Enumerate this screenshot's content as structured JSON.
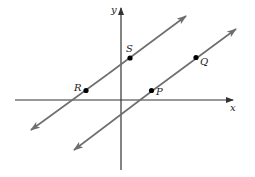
{
  "diagram": {
    "type": "coordinate-plane",
    "colors": {
      "axis": "#333333",
      "line": "#6e6e6e",
      "point": "#000000",
      "text": "#222222"
    },
    "axes": {
      "x": {
        "label": "x"
      },
      "y": {
        "label": "y"
      }
    },
    "lines": [
      {
        "name": "line-RS",
        "points": [
          "R",
          "S"
        ]
      },
      {
        "name": "line-PQ",
        "points": [
          "P",
          "Q"
        ]
      }
    ],
    "points": [
      {
        "label": "R",
        "line": "line-RS",
        "quadrant": "II"
      },
      {
        "label": "S",
        "line": "line-RS",
        "location": "y-axis side, above x-axis"
      },
      {
        "label": "P",
        "line": "line-PQ",
        "quadrant": "I"
      },
      {
        "label": "Q",
        "line": "line-PQ",
        "quadrant": "I"
      }
    ]
  }
}
